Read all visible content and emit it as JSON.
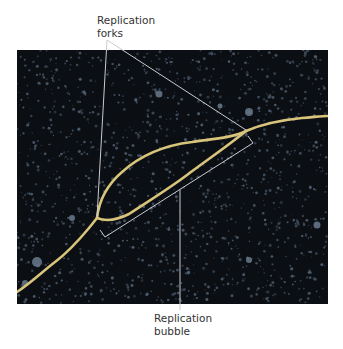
{
  "figure": {
    "labels": {
      "forks_line1": "Replication",
      "forks_line2": "forks",
      "bubble_line1": "Replication",
      "bubble_line2": "bubble"
    },
    "colors": {
      "background": "#0b0e13",
      "speckle": "#55677a",
      "dna_strand": "#d8c47a",
      "leader_line": "#c8ccd2"
    }
  }
}
